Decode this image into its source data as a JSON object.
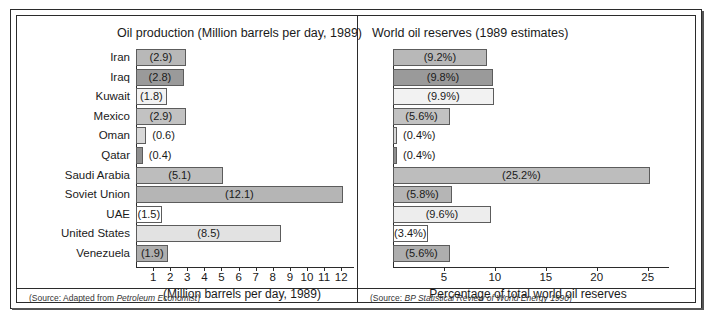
{
  "figure": {
    "outer_border_color": "#2b2b2b",
    "background": "#ffffff"
  },
  "chart_data": [
    {
      "type": "bar",
      "orientation": "horizontal",
      "id": "oil-production",
      "title": "Oil production (Million barrels per day, 1989)",
      "xlabel": "(Million barrels per day, 1989)",
      "ylabel": "",
      "xlim": [
        0,
        12.4
      ],
      "xticks": [
        1,
        2,
        3,
        4,
        5,
        6,
        7,
        8,
        9,
        10,
        11,
        12
      ],
      "xticklabels": [
        "1",
        "2",
        "3",
        "4",
        "5",
        "6",
        "7",
        "8",
        "9",
        "10",
        "11",
        "12"
      ],
      "grid": false,
      "legend": "none",
      "source": "(Source: Adapted from Petroleum Economist)",
      "source_prefix": "(Source: Adapted from ",
      "source_italic": "Petroleum Economist",
      "source_suffix": ")",
      "categories": [
        "Iran",
        "Iraq",
        "Kuwait",
        "Mexico",
        "Oman",
        "Qatar",
        "Saudi Arabia",
        "Soviet Union",
        "UAE",
        "United States",
        "Venezuela"
      ],
      "values": [
        2.9,
        2.8,
        1.8,
        2.9,
        0.6,
        0.4,
        5.1,
        12.1,
        1.5,
        8.5,
        1.9
      ],
      "value_labels": [
        "(2.9)",
        "(2.8)",
        "(1.8)",
        "(2.9)",
        "(0.6)",
        "(0.4)",
        "(5.1)",
        "(12.1)",
        "(1.5)",
        "(8.5)",
        "(1.9)"
      ],
      "bar_colors": [
        "#b8b8b8",
        "#9a9a9a",
        "#f2f2f2",
        "#c2c2c2",
        "#d8d8d8",
        "#8f8f8f",
        "#bdbdbd",
        "#b5b5b5",
        "#ffffff",
        "#e2e2e2",
        "#aeaeae"
      ],
      "label_inside": [
        true,
        true,
        true,
        true,
        false,
        false,
        true,
        true,
        true,
        true,
        true
      ]
    },
    {
      "type": "bar",
      "orientation": "horizontal",
      "id": "world-oil-reserves",
      "title": "World oil reserves (1989 estimates)",
      "xlabel": "Percentage of total world oil reserves",
      "ylabel": "",
      "xlim": [
        0,
        26.5
      ],
      "xticks": [
        5,
        10,
        15,
        20,
        25
      ],
      "xticklabels": [
        "5",
        "10",
        "15",
        "20",
        "25"
      ],
      "grid": false,
      "legend": "none",
      "source": "(Source: BP Statistical Review of World Energy 1990)",
      "source_prefix": "(Source: ",
      "source_italic": "BP Statistical Review of World Energy 1990",
      "source_suffix": ")",
      "categories": [
        "Iran",
        "Iraq",
        "Kuwait",
        "Mexico",
        "Oman",
        "Qatar",
        "Saudi Arabia",
        "Soviet Union",
        "UAE",
        "United States",
        "Venezuela"
      ],
      "values": [
        9.2,
        9.8,
        9.9,
        5.6,
        0.4,
        0.4,
        25.2,
        5.8,
        9.6,
        3.4,
        5.6
      ],
      "value_labels": [
        "(9.2%)",
        "(9.8%)",
        "(9.9%)",
        "(5.6%)",
        "(0.4%)",
        "(0.4%)",
        "(25.2%)",
        "(5.8%)",
        "(9.6%)",
        "(3.4%)",
        "(5.6%)"
      ],
      "bar_colors": [
        "#b8b8b8",
        "#9a9a9a",
        "#f2f2f2",
        "#c2c2c2",
        "#d8d8d8",
        "#8f8f8f",
        "#bdbdbd",
        "#b5b5b5",
        "#ededed",
        "#ffffff",
        "#aeaeae"
      ],
      "label_inside": [
        true,
        true,
        true,
        true,
        false,
        false,
        true,
        true,
        true,
        true,
        true
      ]
    }
  ]
}
